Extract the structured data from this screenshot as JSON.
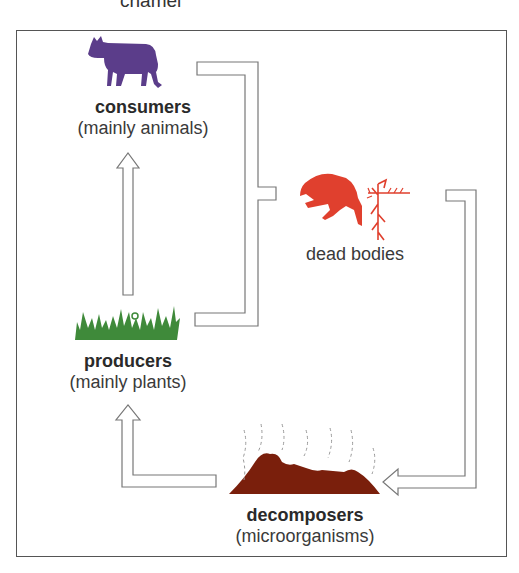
{
  "caption_fragment": "chamel",
  "nodes": {
    "consumers": {
      "title": "consumers",
      "subtitle": "(mainly animals)",
      "icon": "cow-icon",
      "color": "#5b3d8a"
    },
    "producers": {
      "title": "producers",
      "subtitle": "(mainly plants)",
      "icon": "grass-icon",
      "color": "#3f8a3a"
    },
    "dead_bodies": {
      "title": "dead bodies",
      "icon": "dead-animal-and-plant-icon",
      "color": "#e0402e"
    },
    "decomposers": {
      "title": "decomposers",
      "subtitle": "(microorganisms)",
      "icon": "decomposing-mound-icon",
      "color": "#7a1f0c"
    }
  },
  "edges": [
    {
      "from": "producers",
      "to": "consumers",
      "style": "hollow-arrow"
    },
    {
      "from": "consumers",
      "to": "dead_bodies",
      "style": "bracket-merge"
    },
    {
      "from": "producers",
      "to": "dead_bodies",
      "style": "bracket-merge"
    },
    {
      "from": "dead_bodies",
      "to": "decomposers",
      "style": "hollow-arrow"
    },
    {
      "from": "decomposers",
      "to": "producers",
      "style": "hollow-arrow"
    }
  ]
}
